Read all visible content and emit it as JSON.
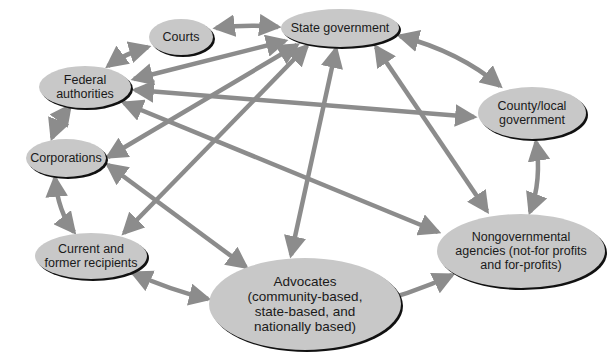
{
  "diagram": {
    "type": "network",
    "colors": {
      "node_fill": "#c8c8c8",
      "node_shadow": "#111111",
      "arrow": "#8c8c8c",
      "text": "#1a1a1a",
      "background": "#ffffff"
    },
    "nodes": [
      {
        "id": "courts",
        "label": "Courts",
        "cx": 181,
        "cy": 37,
        "rx": 32,
        "ry": 18
      },
      {
        "id": "state",
        "label": "State government",
        "cx": 340,
        "cy": 28,
        "rx": 59,
        "ry": 19
      },
      {
        "id": "federal",
        "label": "Federal\nauthorities",
        "cx": 85,
        "cy": 87,
        "rx": 46,
        "ry": 21
      },
      {
        "id": "county",
        "label": "County/local\ngovernment",
        "cx": 532,
        "cy": 113,
        "rx": 54,
        "ry": 26
      },
      {
        "id": "corporations",
        "label": "Corporations",
        "cx": 66,
        "cy": 158,
        "rx": 40,
        "ry": 19
      },
      {
        "id": "recipients",
        "label": "Current and\nformer recipients",
        "cx": 91,
        "cy": 256,
        "rx": 56,
        "ry": 23
      },
      {
        "id": "advocates",
        "label": "Advocates\n(community-based,\nstate-based, and\nnationally based)",
        "cx": 305,
        "cy": 304,
        "rx": 96,
        "ry": 46
      },
      {
        "id": "ngo",
        "label": "Nongovernmental\nagencies (not-for profits\nand for-profits)",
        "cx": 521,
        "cy": 251,
        "rx": 84,
        "ry": 37
      }
    ],
    "edges": [
      {
        "from": "courts",
        "to": "state",
        "bidirectional": true
      },
      {
        "from": "courts",
        "to": "federal",
        "bidirectional": true
      },
      {
        "from": "federal",
        "to": "state",
        "bidirectional": true
      },
      {
        "from": "federal",
        "to": "county",
        "bidirectional": true
      },
      {
        "from": "federal",
        "to": "ngo",
        "bidirectional": true
      },
      {
        "from": "federal",
        "to": "corporations",
        "bidirectional": true
      },
      {
        "from": "state",
        "to": "corporations",
        "bidirectional": true
      },
      {
        "from": "state",
        "to": "recipients",
        "bidirectional": true
      },
      {
        "from": "state",
        "to": "advocates",
        "bidirectional": true
      },
      {
        "from": "state",
        "to": "ngo",
        "bidirectional": true
      },
      {
        "from": "state",
        "to": "county",
        "bidirectional": true
      },
      {
        "from": "corporations",
        "to": "recipients",
        "bidirectional": true
      },
      {
        "from": "corporations",
        "to": "advocates",
        "bidirectional": true
      },
      {
        "from": "county",
        "to": "ngo",
        "bidirectional": true
      },
      {
        "from": "recipients",
        "to": "advocates",
        "bidirectional": true
      },
      {
        "from": "advocates",
        "to": "ngo",
        "bidirectional": true
      }
    ]
  }
}
